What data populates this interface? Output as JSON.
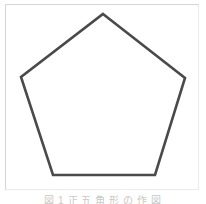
{
  "figure": {
    "caption": "図 1 正 五 角 形 の 作 図",
    "frame": {
      "label": "figure-border",
      "border_color": "#d6d6d6",
      "background_color": "#ffffff"
    },
    "shape": {
      "name": "pentagon",
      "sides": 5,
      "type": "regular-polygon",
      "orientation": "apex-up",
      "stroke_color": "#4a4a4a",
      "stroke_width": 2.6,
      "fill": "none",
      "interior_angle_degrees": 108,
      "vertices": [
        {
          "label": "apex",
          "x": 103,
          "y": 14
        },
        {
          "label": "right",
          "x": 185,
          "y": 78
        },
        {
          "label": "bottom-right",
          "x": 155,
          "y": 175
        },
        {
          "label": "bottom-left",
          "x": 53,
          "y": 175
        },
        {
          "label": "left",
          "x": 21,
          "y": 77
        }
      ],
      "points_attr": "103,14 185,78 155,175 53,175 21,77"
    }
  }
}
